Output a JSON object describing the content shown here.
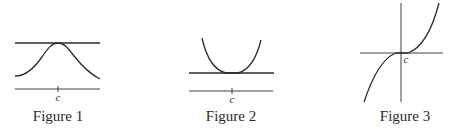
{
  "figures": [
    {
      "caption": "Figure 1",
      "point_label": "c",
      "description": "Curve with a local maximum at c; horizontal tangent line at the peak",
      "stroke_color": "#2a2a2a"
    },
    {
      "caption": "Figure 2",
      "point_label": "c",
      "description": "Curve with a local minimum at c; horizontal tangent line at the bottom",
      "stroke_color": "#2a2a2a"
    },
    {
      "caption": "Figure 3",
      "point_label": "c",
      "description": "Cubic-like curve with horizontal tangent at inflection point c; no extremum",
      "stroke_color": "#2a2a2a"
    }
  ]
}
